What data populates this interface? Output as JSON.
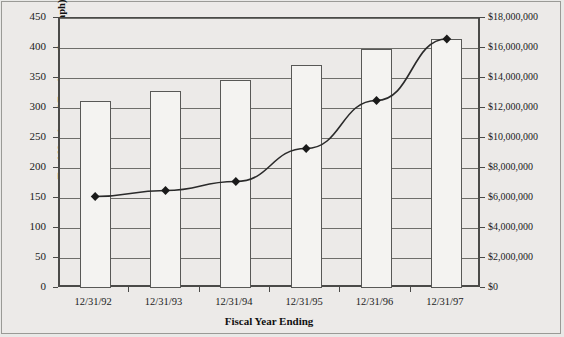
{
  "chart_data": {
    "type": "bar",
    "title": "",
    "xlabel": "Fiscal Year Ending",
    "categories": [
      "12/31/92",
      "12/31/93",
      "12/31/94",
      "12/31/95",
      "12/31/96",
      "12/31/97"
    ],
    "grid": true,
    "legend": "none",
    "series": [
      {
        "name": "Total Number of Employees (bar graph)",
        "chart_type": "bar",
        "axis": "left",
        "values": [
          311,
          328,
          347,
          372,
          398,
          415
        ]
      },
      {
        "name": "Total Revenue Generated (◆)",
        "chart_type": "line",
        "axis": "right",
        "marker": "diamond",
        "values": [
          6100000,
          6500000,
          7100000,
          9300000,
          12500000,
          16600000
        ]
      }
    ],
    "left_axis": {
      "label": "Total Number of Employees (bar graph)",
      "ylim": [
        0,
        450
      ],
      "tick_step": 50,
      "ticks": [
        "0",
        "50",
        "100",
        "150",
        "200",
        "250",
        "300",
        "350",
        "400",
        "450"
      ]
    },
    "right_axis": {
      "label": "Total Revenue Generated (◆)",
      "ylim": [
        0,
        18000000
      ],
      "tick_step": 2000000,
      "ticks": [
        "$0",
        "$2,000,000",
        "$4,000,000",
        "$6,000,000",
        "$8,000,000",
        "$10,000,000",
        "$12,000,000",
        "$14,000,000",
        "$16,000,000",
        "$18,000,000"
      ]
    },
    "colors": {
      "background": "#e9e9e7",
      "plot_background": "#eceae8",
      "bar_fill": "#f4f3f1",
      "bar_border": "#585856",
      "gridline": "#6e6e6a",
      "axis": "#4a4a48",
      "line": "#2a2a2a",
      "marker": "#1a1a1a",
      "text": "#1b1b1b"
    }
  }
}
